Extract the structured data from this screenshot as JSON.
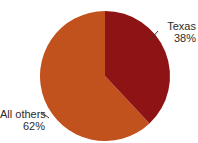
{
  "chart_data": {
    "type": "pie",
    "title": "",
    "subtitle": "",
    "xlabel": "",
    "ylabel": "",
    "legend_position": "none",
    "grid": false,
    "labels_position": "outside-callout",
    "start_angle_deg": 0,
    "direction": "clockwise",
    "categories": [
      "Texas",
      "All others"
    ],
    "values": [
      38,
      62
    ],
    "value_unit": "%",
    "colors": [
      "#8E1315",
      "#C1521D"
    ],
    "slices": [
      {
        "name": "Texas",
        "value": 38,
        "value_label": "38%",
        "color": "#8E1315",
        "callout_side": "right"
      },
      {
        "name": "All others",
        "value": 62,
        "value_label": "62%",
        "color": "#C1521D",
        "callout_side": "left"
      }
    ]
  },
  "figure": {
    "background_color": "#ffffff",
    "text_color": "#2f2b29",
    "leader_line_color": "#3a3330"
  }
}
